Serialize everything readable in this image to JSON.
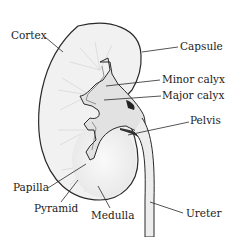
{
  "diagram": {
    "colors": {
      "outline": "#2a2a2a",
      "fill": "#f2f2f2",
      "cortex_fill": "#efefef",
      "calyx_fill": "#dcdcdc",
      "text": "#222222"
    },
    "labels": [
      {
        "id": "cortex",
        "text": "Cortex",
        "side": "left"
      },
      {
        "id": "capsule",
        "text": "Capsule",
        "side": "right"
      },
      {
        "id": "minor-calyx",
        "text": "Minor calyx",
        "side": "right"
      },
      {
        "id": "major-calyx",
        "text": "Major calyx",
        "side": "right"
      },
      {
        "id": "pelvis",
        "text": "Pelvis",
        "side": "right"
      },
      {
        "id": "papilla",
        "text": "Papilla",
        "side": "left"
      },
      {
        "id": "pyramid",
        "text": "Pyramid",
        "side": "bottom"
      },
      {
        "id": "medulla",
        "text": "Medulla",
        "side": "bottom"
      },
      {
        "id": "ureter",
        "text": "Ureter",
        "side": "right"
      }
    ]
  }
}
